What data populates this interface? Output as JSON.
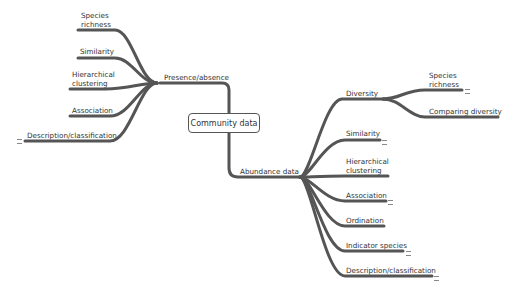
{
  "root": {
    "label": "Community data"
  },
  "branches": {
    "presence_absence": {
      "label": "Presence/absence",
      "children": [
        {
          "label": "Species richness",
          "lines": [
            "Species",
            "richness"
          ]
        },
        {
          "label": "Similarity",
          "lines": [
            "Similarity"
          ]
        },
        {
          "label": "Hierarchical clustering",
          "lines": [
            "Hierarchical",
            "clustering"
          ]
        },
        {
          "label": "Association",
          "lines": [
            "Association"
          ]
        },
        {
          "label": "Description/classification",
          "lines": [
            "Description/classification"
          ],
          "has_note_marker": true
        }
      ]
    },
    "abundance": {
      "label": "Abundance data",
      "children": [
        {
          "label": "Diversity",
          "lines": [
            "Diversity"
          ],
          "children": [
            {
              "label": "Species richness",
              "lines": [
                "Species",
                "richness"
              ],
              "has_note_marker": true
            },
            {
              "label": "Comparing diversity",
              "lines": [
                "Comparing diversity"
              ]
            }
          ]
        },
        {
          "label": "Similarity",
          "lines": [
            "Similarity"
          ],
          "has_note_marker": true
        },
        {
          "label": "Hierarchical clustering",
          "lines": [
            "Hierarchical",
            "clustering"
          ]
        },
        {
          "label": "Association",
          "lines": [
            "Association"
          ],
          "has_note_marker": true
        },
        {
          "label": "Ordination",
          "lines": [
            "Ordination"
          ]
        },
        {
          "label": "Indicator species",
          "lines": [
            "Indicator species"
          ],
          "has_note_marker": true
        },
        {
          "label": "Description/classification",
          "lines": [
            "Description/classification"
          ],
          "has_note_marker": true
        }
      ]
    }
  },
  "colors": {
    "branch": "#555555",
    "text": "#333333",
    "background": "#ffffff"
  }
}
